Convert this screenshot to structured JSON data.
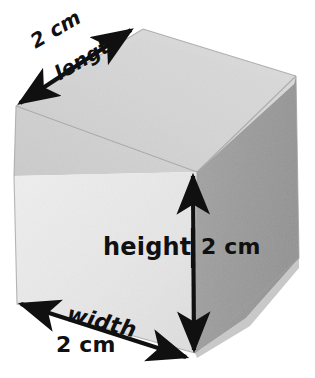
{
  "figure": {
    "shape": "cube",
    "background_color": "#ffffff",
    "faces": {
      "front": {
        "name": "front-face",
        "color": "#e9e9e9"
      },
      "top": {
        "name": "top-face",
        "color": "#d2d2d2"
      },
      "right": {
        "name": "right-face",
        "color": "#9c9c9c"
      }
    },
    "outline_color": "#8a8a8a",
    "arrow_color": "#101010"
  },
  "labels": {
    "length": {
      "value": "2 cm",
      "name": "length"
    },
    "height": {
      "value": "2 cm",
      "name": "height"
    },
    "width": {
      "value": "2 cm",
      "name": "width"
    }
  },
  "dimensions": [
    {
      "edge": "length",
      "measure": "2 cm",
      "direction": "diagonal-up-right"
    },
    {
      "edge": "height",
      "measure": "2 cm",
      "direction": "vertical"
    },
    {
      "edge": "width",
      "measure": "2 cm",
      "direction": "diagonal-down-right"
    }
  ]
}
